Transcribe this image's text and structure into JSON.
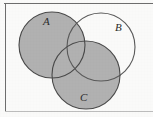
{
  "figure": {
    "kind": "venn-diagram",
    "set_count": 3,
    "background_color": "#fbfbfa",
    "shaded_color": "#b8b8b8",
    "unshaded_color": "#ffffff",
    "outline_color": "#4a4a4a",
    "frame_color": "#6e6e6e",
    "shaded_description": "A union C"
  },
  "labels": {
    "a": "A",
    "b": "B",
    "c": "C"
  },
  "circles": [
    {
      "id": "A",
      "label": "A",
      "cx": 52,
      "cy": 45,
      "r": 33,
      "filled": true,
      "fill": "#b8b8b8"
    },
    {
      "id": "B",
      "label": "B",
      "cx": 101,
      "cy": 47,
      "r": 34,
      "filled": false,
      "fill": "#ffffff"
    },
    {
      "id": "C",
      "label": "C",
      "cx": 86,
      "cy": 75,
      "r": 34,
      "filled": true,
      "fill": "#b8b8b8"
    }
  ],
  "frame": {
    "top_rule": "horizontal-rule-top",
    "left_rule": "vertical-rule-left",
    "bottom_rule": "horizontal-rule-bottom"
  }
}
